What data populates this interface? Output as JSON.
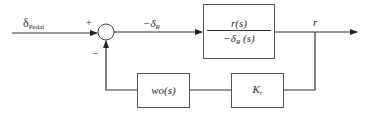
{
  "diagram": {
    "input": {
      "symbol": "δ",
      "subscript": "Pedal"
    },
    "summing_junction": {
      "plus_sign": "+",
      "minus_sign": "−"
    },
    "error_signal": {
      "prefix": "−δ",
      "subscript": "R"
    },
    "forward_block": {
      "numerator": "r(s)",
      "denominator_prefix": "−δ",
      "denominator_subscript": "R",
      "denominator_suffix": " (s)"
    },
    "output": {
      "label": "r"
    },
    "feedback_blocks": [
      {
        "label": "wo(s)"
      },
      {
        "symbol": "K",
        "subscript": "r"
      }
    ],
    "colors": {
      "line": "#333333",
      "box_border": "#555555",
      "text": "#2a2a2a"
    }
  }
}
